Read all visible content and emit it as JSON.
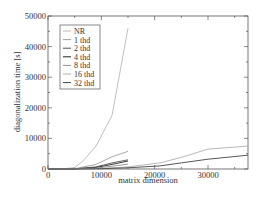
{
  "chart_data": {
    "type": "line",
    "title": "",
    "xlabel": "matrix dimension",
    "ylabel": "diagonalization time [s]",
    "xlim": [
      0,
      37500
    ],
    "ylim": [
      0,
      50000
    ],
    "xticks": [
      0,
      10000,
      20000,
      30000
    ],
    "yticks": [
      0,
      10000,
      20000,
      30000,
      40000,
      50000
    ],
    "grid": false,
    "legend_position": "upper-left",
    "series": [
      {
        "name": "NR",
        "color": "#b8b8b8",
        "x": [
          0,
          2500,
          5000,
          6500,
          9000,
          12000,
          15000
        ],
        "y": [
          0,
          0,
          500,
          2500,
          7500,
          17500,
          46000
        ]
      },
      {
        "name": "1 thd",
        "color": "#a0a0a0",
        "x": [
          0,
          5000,
          9000,
          12000,
          15000
        ],
        "y": [
          0,
          100,
          1500,
          4000,
          5800
        ]
      },
      {
        "name": "2 thd",
        "color": "#555555",
        "x": [
          0,
          5000,
          9000,
          12000,
          15000
        ],
        "y": [
          0,
          50,
          700,
          2000,
          3000
        ]
      },
      {
        "name": "4 thd",
        "color": "#222222",
        "x": [
          0,
          5000,
          9000,
          12000,
          15000
        ],
        "y": [
          0,
          30,
          500,
          1500,
          2600
        ]
      },
      {
        "name": "8 thd",
        "color": "#909090",
        "x": [
          0,
          5000,
          9000,
          12000,
          15000
        ],
        "y": [
          0,
          20,
          300,
          900,
          1600
        ]
      },
      {
        "name": "16 thd",
        "color": "#b0b0b0",
        "x": [
          0,
          5000,
          10000,
          15000,
          21000,
          25000,
          30000,
          37500
        ],
        "y": [
          0,
          10,
          200,
          700,
          2000,
          3800,
          6500,
          7500
        ]
      },
      {
        "name": "32 thd",
        "color": "#444444",
        "x": [
          0,
          5000,
          10000,
          15000,
          21000,
          25000,
          30000,
          37500
        ],
        "y": [
          0,
          5,
          100,
          400,
          1000,
          2000,
          3200,
          4500
        ]
      }
    ]
  },
  "axes": {
    "xlabel": "matrix dimension",
    "ylabel": "diagonalization time [s]",
    "xtick_labels": [
      "0",
      "10000",
      "20000",
      "30000"
    ],
    "ytick_labels": [
      "0",
      "10000",
      "20000",
      "30000",
      "40000",
      "50000"
    ]
  },
  "legend": {
    "items": [
      "NR",
      "1 thd",
      "2 thd",
      "4 thd",
      "8 thd",
      "16 thd",
      "32 thd"
    ]
  }
}
